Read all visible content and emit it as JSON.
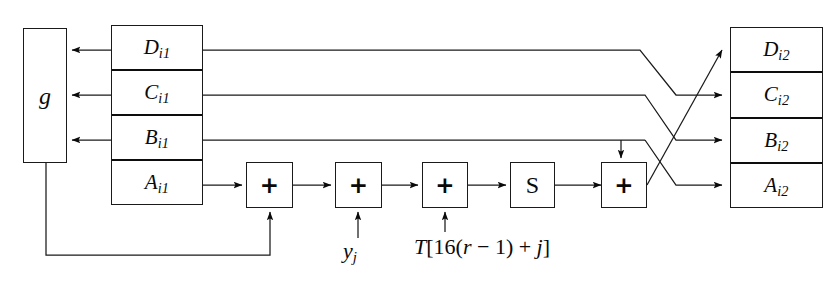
{
  "diagram": {
    "ink_color": "#0a0a0a",
    "background_color": "#ffffff"
  },
  "g_box": {
    "label": "g",
    "name": "nonlinear-function-g"
  },
  "input_registers": {
    "name": "input-register-stack",
    "cells": [
      {
        "letter": "D",
        "sub": "i1",
        "name": "register-D-i1"
      },
      {
        "letter": "C",
        "sub": "i1",
        "name": "register-C-i1"
      },
      {
        "letter": "B",
        "sub": "i1",
        "name": "register-B-i1"
      },
      {
        "letter": "A",
        "sub": "i1",
        "name": "register-A-i1"
      }
    ]
  },
  "output_registers": {
    "name": "output-register-stack",
    "cells": [
      {
        "letter": "D",
        "sub": "i2",
        "name": "register-D-i2"
      },
      {
        "letter": "C",
        "sub": "i2",
        "name": "register-C-i2"
      },
      {
        "letter": "B",
        "sub": "i2",
        "name": "register-B-i2"
      },
      {
        "letter": "A",
        "sub": "i2",
        "name": "register-A-i2"
      }
    ]
  },
  "operators": [
    {
      "symbol": "+",
      "name": "adder-1-g-output"
    },
    {
      "symbol": "+",
      "name": "adder-2-message-word"
    },
    {
      "symbol": "+",
      "name": "adder-3-sine-table"
    },
    {
      "symbol": "S",
      "name": "circular-shift-s"
    },
    {
      "symbol": "+",
      "name": "adder-4-b-feedback"
    }
  ],
  "labels": {
    "y_sub": {
      "base": "y",
      "sub": "j",
      "name": "message-word-label"
    },
    "t_table": {
      "text": "T[16(r − 1) + j]",
      "parts": {
        "T": "T",
        "bracket_open": "[",
        "sixteen": "16(",
        "r": "r",
        "minus_one": " − 1) + ",
        "j": "j",
        "bracket_close": "]"
      },
      "name": "sine-table-label"
    }
  }
}
